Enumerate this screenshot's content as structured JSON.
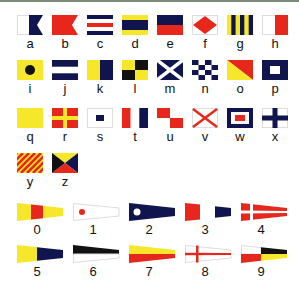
{
  "letters": [
    {
      "label": "a",
      "name": "alfa"
    },
    {
      "label": "b",
      "name": "bravo"
    },
    {
      "label": "c",
      "name": "charlie"
    },
    {
      "label": "d",
      "name": "delta"
    },
    {
      "label": "e",
      "name": "echo"
    },
    {
      "label": "f",
      "name": "foxtrot"
    },
    {
      "label": "g",
      "name": "golf"
    },
    {
      "label": "h",
      "name": "hotel"
    },
    {
      "label": "i",
      "name": "india"
    },
    {
      "label": "j",
      "name": "juliett"
    },
    {
      "label": "k",
      "name": "kilo"
    },
    {
      "label": "l",
      "name": "lima"
    },
    {
      "label": "m",
      "name": "mike"
    },
    {
      "label": "n",
      "name": "november"
    },
    {
      "label": "o",
      "name": "oscar"
    },
    {
      "label": "p",
      "name": "papa"
    },
    {
      "label": "q",
      "name": "quebec"
    },
    {
      "label": "r",
      "name": "romeo"
    },
    {
      "label": "s",
      "name": "sierra"
    },
    {
      "label": "t",
      "name": "tango"
    },
    {
      "label": "u",
      "name": "uniform"
    },
    {
      "label": "v",
      "name": "victor"
    },
    {
      "label": "w",
      "name": "whiskey"
    },
    {
      "label": "x",
      "name": "xray"
    },
    {
      "label": "y",
      "name": "yankee"
    },
    {
      "label": "z",
      "name": "zulu"
    }
  ],
  "numbers": [
    {
      "label": "0"
    },
    {
      "label": "1"
    },
    {
      "label": "2"
    },
    {
      "label": "3"
    },
    {
      "label": "4"
    },
    {
      "label": "5"
    },
    {
      "label": "6"
    },
    {
      "label": "7"
    },
    {
      "label": "8"
    },
    {
      "label": "9"
    }
  ],
  "colors": {
    "red": "#e8271c",
    "blue": "#10154f",
    "yellow": "#f7e72a",
    "black": "#111111",
    "white": "#ffffff",
    "border": "#d0d0d0"
  }
}
